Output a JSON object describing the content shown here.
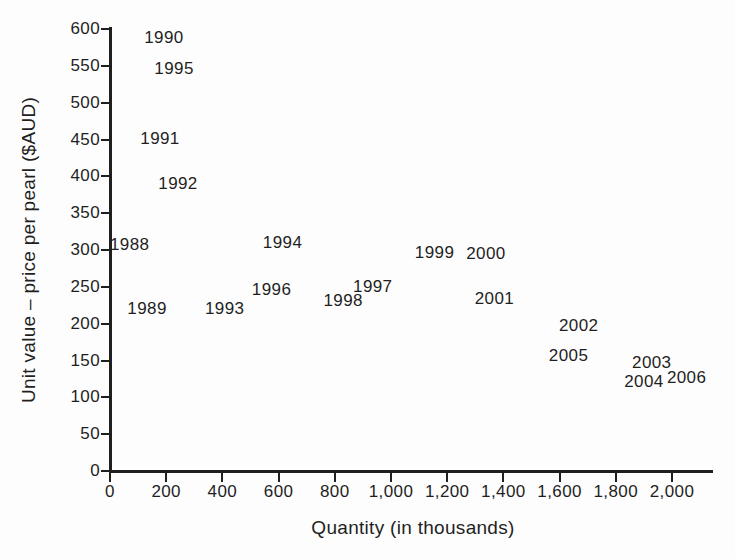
{
  "colors": {
    "ink": "#1f1f1f",
    "background": "#fdfdfd"
  },
  "chart_data": {
    "type": "scatter",
    "title": "",
    "xlabel": "Quantity (in thousands)",
    "ylabel": "Unit value – price per pearl ($AUD)",
    "xlim": [
      0,
      2140
    ],
    "ylim": [
      0,
      600
    ],
    "grid": false,
    "legend": false,
    "marker": "year text labels placed at data points",
    "x_ticks": [
      0,
      200,
      400,
      600,
      800,
      1000,
      1200,
      1400,
      1600,
      1800,
      2000
    ],
    "x_tick_labels": [
      "0",
      "200",
      "400",
      "600",
      "800",
      "1,000",
      "1,200",
      "1,400",
      "1,600",
      "1,800",
      "2,000"
    ],
    "y_ticks": [
      0,
      50,
      100,
      150,
      200,
      250,
      300,
      350,
      400,
      450,
      500,
      550,
      600
    ],
    "y_tick_labels": [
      "0",
      "50",
      "100",
      "150",
      "200",
      "250",
      "300",
      "350",
      "400",
      "450",
      "500",
      "550",
      "600"
    ],
    "points": [
      {
        "year": "1988",
        "x": 70,
        "y": 305
      },
      {
        "year": "1989",
        "x": 132,
        "y": 218
      },
      {
        "year": "1990",
        "x": 192,
        "y": 587
      },
      {
        "year": "1991",
        "x": 178,
        "y": 450
      },
      {
        "year": "1992",
        "x": 242,
        "y": 388
      },
      {
        "year": "1993",
        "x": 408,
        "y": 218
      },
      {
        "year": "1994",
        "x": 614,
        "y": 308
      },
      {
        "year": "1995",
        "x": 228,
        "y": 545
      },
      {
        "year": "1996",
        "x": 575,
        "y": 245
      },
      {
        "year": "1997",
        "x": 935,
        "y": 248
      },
      {
        "year": "1998",
        "x": 830,
        "y": 230
      },
      {
        "year": "1999",
        "x": 1155,
        "y": 295
      },
      {
        "year": "2000",
        "x": 1338,
        "y": 293
      },
      {
        "year": "2001",
        "x": 1368,
        "y": 232
      },
      {
        "year": "2002",
        "x": 1668,
        "y": 195
      },
      {
        "year": "2003",
        "x": 1928,
        "y": 145
      },
      {
        "year": "2004",
        "x": 1900,
        "y": 120
      },
      {
        "year": "2005",
        "x": 1632,
        "y": 155
      },
      {
        "year": "2006",
        "x": 2052,
        "y": 125
      }
    ]
  }
}
